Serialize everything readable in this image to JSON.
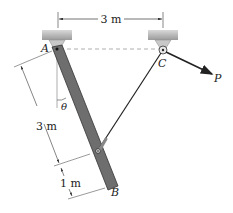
{
  "diagram": {
    "type": "statics-mechanics-figure",
    "points": {
      "A": {
        "label": "A"
      },
      "B": {
        "label": "B"
      },
      "C": {
        "label": "C"
      }
    },
    "force": {
      "label": "P"
    },
    "angle": {
      "label": "θ"
    },
    "dimensions": {
      "top_span": "3 m",
      "bar_upper": "3 m",
      "bar_lower": "1 m"
    },
    "colors": {
      "bar_fill": "#6e6e6e",
      "bar_edge": "#333333",
      "support_fill": "#bdbdbd",
      "line": "#222222",
      "dashed": "#999999"
    }
  }
}
